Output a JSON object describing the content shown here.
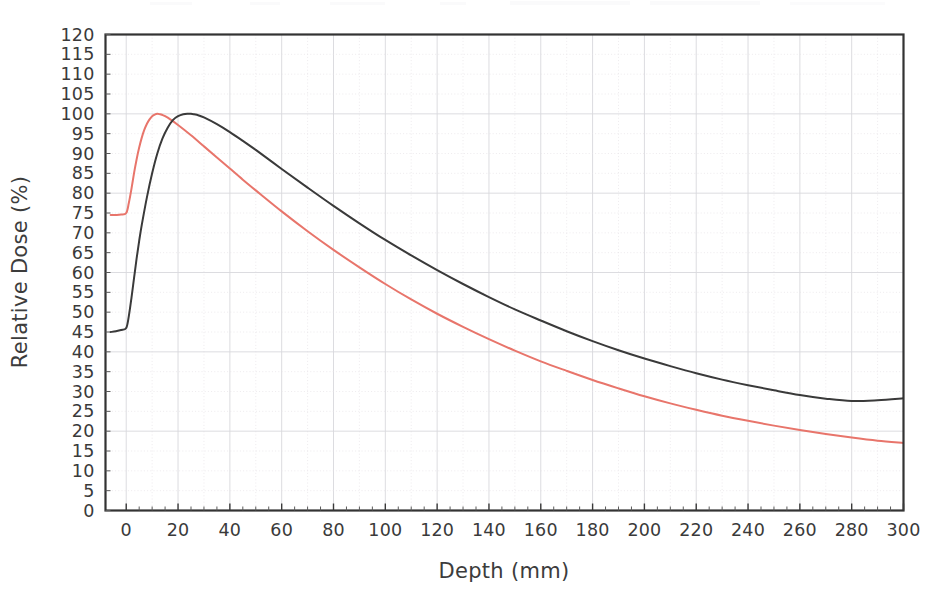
{
  "chart_data": {
    "type": "line",
    "title": "",
    "subtitle": "",
    "xlabel": "Depth (mm)",
    "ylabel": "Relative Dose (%)",
    "xlim": [
      -8,
      300
    ],
    "ylim": [
      0,
      120
    ],
    "xticks": [
      0,
      20,
      40,
      60,
      80,
      100,
      120,
      140,
      160,
      180,
      200,
      220,
      240,
      260,
      280,
      300
    ],
    "yticks": [
      0,
      5,
      10,
      15,
      20,
      25,
      30,
      35,
      40,
      45,
      50,
      55,
      60,
      65,
      70,
      75,
      80,
      85,
      90,
      95,
      100,
      105,
      110,
      115,
      120
    ],
    "xtick_labels": [
      "0",
      "20",
      "40",
      "60",
      "80",
      "100",
      "120",
      "140",
      "160",
      "180",
      "200",
      "220",
      "240",
      "260",
      "280",
      "300"
    ],
    "ytick_labels": [
      "0",
      "5",
      "10",
      "15",
      "20",
      "25",
      "30",
      "35",
      "40",
      "45",
      "50",
      "55",
      "60",
      "65",
      "70",
      "75",
      "80",
      "85",
      "90",
      "95",
      "100",
      "105",
      "110",
      "115",
      "120"
    ],
    "grid": true,
    "grid_major_color": "#d8d8dc",
    "grid_minor_color": "#e6e3e6",
    "legend": null,
    "legend_position": "none",
    "annotations": [],
    "series": [
      {
        "name": "Percentage Depth Dose - lower energy",
        "color": "#e8756b",
        "x": [
          -6,
          -4,
          -2,
          0,
          1,
          2,
          3,
          4,
          5,
          6,
          7,
          8,
          9,
          10,
          11,
          12,
          13,
          14,
          15,
          17,
          20,
          25,
          30,
          35,
          40,
          45,
          50,
          60,
          70,
          80,
          90,
          100,
          110,
          120,
          130,
          140,
          150,
          160,
          170,
          180,
          190,
          200,
          210,
          220,
          230,
          240,
          250,
          260,
          270,
          280,
          290,
          300
        ],
        "y": [
          74.5,
          74.5,
          74.6,
          75.0,
          77.5,
          81.0,
          85.0,
          88.5,
          91.5,
          94.0,
          96.0,
          97.5,
          98.6,
          99.4,
          99.8,
          100.0,
          99.9,
          99.7,
          99.4,
          98.6,
          97.2,
          94.6,
          91.8,
          89.0,
          86.2,
          83.4,
          80.7,
          75.4,
          70.4,
          65.7,
          61.3,
          57.1,
          53.2,
          49.6,
          46.3,
          43.2,
          40.3,
          37.6,
          35.2,
          32.9,
          30.8,
          28.8,
          27.0,
          25.4,
          23.9,
          22.6,
          21.4,
          20.3,
          19.3,
          18.4,
          17.6,
          17.0
        ],
        "style": "solid"
      },
      {
        "name": "Percentage Depth Dose - higher energy",
        "color": "#3a3a3a",
        "x": [
          -6,
          -4,
          -2,
          0,
          1,
          2,
          3,
          4,
          5,
          6,
          8,
          10,
          12,
          14,
          16,
          18,
          20,
          22,
          24,
          25,
          26,
          28,
          30,
          35,
          40,
          45,
          50,
          60,
          70,
          80,
          90,
          100,
          110,
          120,
          130,
          140,
          150,
          160,
          170,
          180,
          190,
          200,
          210,
          220,
          230,
          240,
          250,
          260,
          270,
          280,
          290,
          300
        ],
        "y": [
          45.0,
          45.2,
          45.5,
          46.0,
          49.0,
          53.5,
          58.5,
          63.5,
          68.0,
          72.0,
          79.0,
          85.0,
          90.0,
          93.8,
          96.5,
          98.4,
          99.4,
          99.9,
          100.0,
          100.0,
          99.9,
          99.6,
          99.1,
          97.4,
          95.4,
          93.2,
          90.9,
          86.1,
          81.4,
          76.8,
          72.4,
          68.2,
          64.3,
          60.6,
          57.1,
          53.8,
          50.7,
          47.9,
          45.2,
          42.7,
          40.4,
          38.3,
          36.4,
          34.6,
          33.0,
          31.6,
          30.3,
          29.1,
          28.2,
          27.6,
          27.8,
          28.3
        ],
        "style": "solid"
      }
    ]
  },
  "plot": {
    "background_color": "#ffffff",
    "frame_color": "#333333"
  }
}
